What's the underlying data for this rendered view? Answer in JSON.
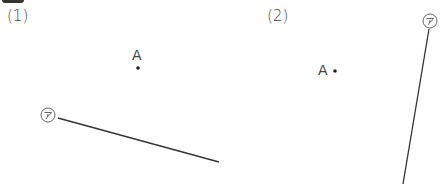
{
  "problems": [
    {
      "number_label": "(1)",
      "point": {
        "name": "A",
        "x": 138,
        "y": 68
      },
      "line": {
        "name": "㋐",
        "x1": 58,
        "y1": 118,
        "x2": 219,
        "y2": 162
      },
      "line_label_pos": {
        "x": 47,
        "y": 115
      }
    },
    {
      "number_label": "(2)",
      "point": {
        "name": "A",
        "x": 335,
        "y": 71
      },
      "line": {
        "name": "㋐",
        "x1": 429,
        "y1": 29,
        "x2": 403,
        "y2": 184
      },
      "line_label_pos": {
        "x": 430,
        "y": 21
      }
    }
  ]
}
